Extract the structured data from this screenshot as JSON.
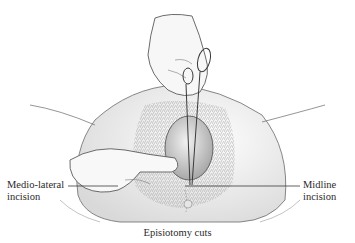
{
  "figure": {
    "caption": "Episiotomy cuts",
    "labels": {
      "left": {
        "line1": "Medio-lateral",
        "line2": "incision"
      },
      "right": {
        "line1": "Midline",
        "line2": "incision"
      }
    }
  },
  "colors": {
    "ink": "#2a2a2a",
    "shade": "#9a9a9a",
    "background": "#ffffff"
  }
}
